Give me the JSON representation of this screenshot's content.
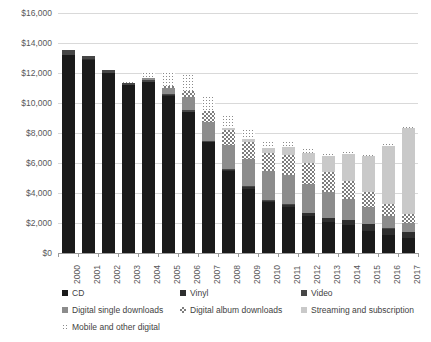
{
  "chart_data": {
    "type": "bar",
    "stacked": true,
    "title": "",
    "subtitle": "",
    "xlabel": "",
    "ylabel": "",
    "ylim": [
      0,
      16000
    ],
    "ytick_step": 2000,
    "ytick_labels": [
      "$0",
      "$2,000",
      "$4,000",
      "$6,000",
      "$8,000",
      "$10,000",
      "$12,000",
      "$14,000",
      "$16,000"
    ],
    "ytick_values": [
      0,
      2000,
      4000,
      6000,
      8000,
      10000,
      12000,
      14000,
      16000
    ],
    "grid": true,
    "legend_position": "bottom",
    "categories": [
      "2000",
      "2001",
      "2002",
      "2003",
      "2004",
      "2005",
      "2006",
      "2007",
      "2008",
      "2009",
      "2010",
      "2011",
      "2012",
      "2013",
      "2014",
      "2015",
      "2016",
      "2017"
    ],
    "series": [
      {
        "name": "CD",
        "color": "#1a1a1a",
        "pattern": "solid",
        "values": [
          13200,
          12900,
          12000,
          11200,
          11400,
          10500,
          9400,
          7400,
          5500,
          4300,
          3400,
          3100,
          2500,
          2100,
          1900,
          1500,
          1200,
          1000
        ]
      },
      {
        "name": "Vinyl",
        "color": "#2e2e2e",
        "pattern": "solid",
        "values": [
          30,
          30,
          30,
          25,
          25,
          20,
          25,
          25,
          55,
          85,
          90,
          120,
          165,
          210,
          300,
          420,
          430,
          400
        ]
      },
      {
        "name": "Video",
        "color": "#464646",
        "pattern": "solid",
        "values": [
          280,
          200,
          140,
          110,
          90,
          90,
          80,
          70,
          60,
          55,
          50,
          40,
          35,
          30,
          25,
          25,
          25,
          25
        ]
      },
      {
        "name": "Digital single downloads",
        "color": "#8c8c8c",
        "pattern": "solid",
        "values": [
          0,
          0,
          0,
          0,
          130,
          380,
          900,
          1250,
          1600,
          1800,
          1900,
          1950,
          1900,
          1700,
          1400,
          1100,
          800,
          600
        ]
      },
      {
        "name": "Digital album downloads",
        "color": "#7d7d7d",
        "pattern": "checker",
        "values": [
          0,
          0,
          0,
          0,
          0,
          130,
          400,
          700,
          1000,
          1150,
          1250,
          1350,
          1400,
          1350,
          1200,
          1050,
          800,
          600
        ]
      },
      {
        "name": "Streaming and subscription",
        "color": "#c9c9c9",
        "pattern": "solid",
        "values": [
          0,
          0,
          0,
          0,
          0,
          0,
          0,
          50,
          100,
          180,
          300,
          480,
          700,
          1050,
          1800,
          2350,
          3900,
          5700
        ]
      },
      {
        "name": "Mobile and other digital",
        "color": "#8a8a8a",
        "pattern": "dots",
        "values": [
          0,
          0,
          0,
          150,
          400,
          950,
          1100,
          1000,
          900,
          700,
          500,
          400,
          300,
          250,
          200,
          150,
          150,
          150
        ]
      }
    ],
    "totals": [
      13510,
      13130,
      12170,
      11485,
      12045,
      12070,
      11905,
      10495,
      9215,
      8270,
      7490,
      7440,
      7000,
      6690,
      6825,
      6595,
      7305,
      8475
    ]
  },
  "axis": {
    "y_ticks": [
      {
        "label": "$16,000",
        "value": 16000
      },
      {
        "label": "$14,000",
        "value": 14000
      },
      {
        "label": "$12,000",
        "value": 12000
      },
      {
        "label": "$10,000",
        "value": 10000
      },
      {
        "label": "$8,000",
        "value": 8000
      },
      {
        "label": "$6,000",
        "value": 6000
      },
      {
        "label": "$4,000",
        "value": 4000
      },
      {
        "label": "$2,000",
        "value": 2000
      },
      {
        "label": "$0",
        "value": 0
      }
    ],
    "x_ticks": [
      "2000",
      "2001",
      "2002",
      "2003",
      "2004",
      "2005",
      "2006",
      "2007",
      "2008",
      "2009",
      "2010",
      "2011",
      "2012",
      "2013",
      "2014",
      "2015",
      "2016",
      "2017"
    ]
  },
  "legend": {
    "rows": [
      [
        {
          "label": "CD",
          "swatch": "cd",
          "x": 6
        },
        {
          "label": "Vinyl",
          "swatch": "vinyl",
          "x": 124
        },
        {
          "label": "Video",
          "swatch": "video",
          "x": 245
        }
      ],
      [
        {
          "label": "Digital single downloads",
          "swatch": "dsd",
          "x": 6
        },
        {
          "label": "Digital album downloads",
          "swatch": "dad",
          "x": 124
        },
        {
          "label": "Streaming and subscription",
          "swatch": "stream",
          "x": 245
        }
      ],
      [
        {
          "label": "Mobile and other digital",
          "swatch": "mobile",
          "x": 6
        }
      ]
    ]
  }
}
